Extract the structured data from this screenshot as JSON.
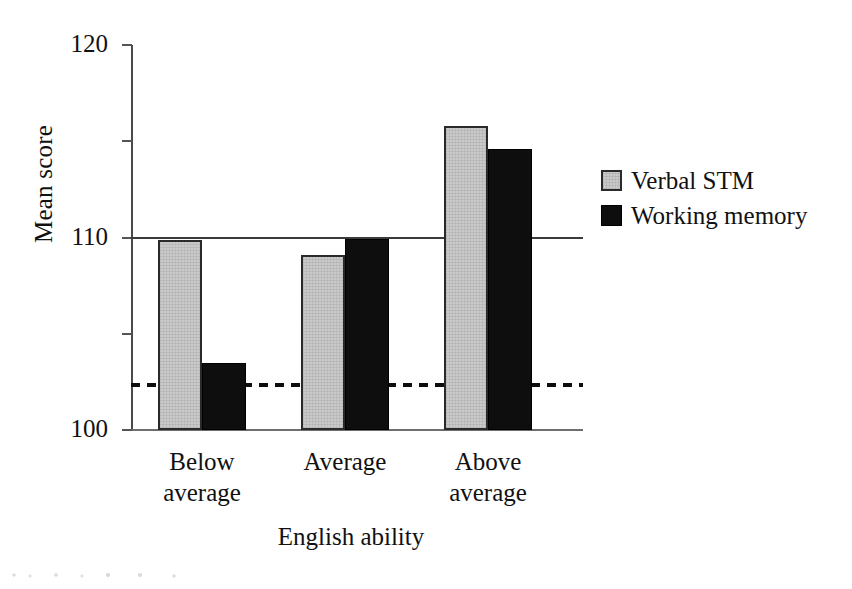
{
  "chart_data": {
    "type": "bar",
    "title": "",
    "xlabel": "English ability",
    "ylabel": "Mean score",
    "categories": [
      "Below average",
      "Average",
      "Above average"
    ],
    "category_lines": [
      [
        "Below",
        "average"
      ],
      [
        "Average"
      ],
      [
        "Above",
        "average"
      ]
    ],
    "series": [
      {
        "name": "Verbal STM",
        "color": "#c9c9c9",
        "values": [
          99.7,
          98.2,
          111.6
        ]
      },
      {
        "name": "Working memory",
        "color": "#0e0e0e",
        "values": [
          87.0,
          99.8,
          109.2
        ]
      }
    ],
    "ylim": [
      80,
      120
    ],
    "yticks": [
      120,
      110,
      100,
      90,
      80
    ],
    "ytick_labels": [
      "120",
      "110",
      "100",
      "90",
      "80"
    ],
    "grid": false,
    "legend_position": "right",
    "reference_lines": [
      {
        "name": "population-mean-line",
        "value": 100,
        "style": "solid"
      },
      {
        "name": "cutoff-line",
        "value": 84.8,
        "style": "dashed"
      }
    ]
  },
  "legend": {
    "items": [
      {
        "label": "Verbal STM",
        "swatch": "verbal-swatch"
      },
      {
        "label": "Working memory",
        "swatch": "working-memory-swatch"
      }
    ]
  }
}
